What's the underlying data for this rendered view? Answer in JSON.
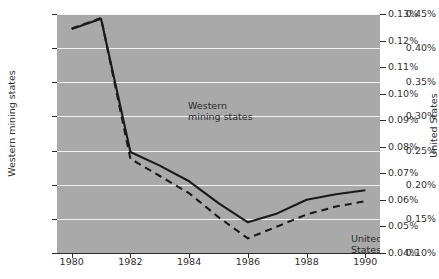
{
  "chart_data": {
    "type": "line",
    "title": "",
    "xlabel": "",
    "ylabel": "Western mining states",
    "y2label": "United States",
    "grid": true,
    "legend_position": "inline-annotation",
    "x": [
      1980,
      1981,
      1982,
      1983,
      1984,
      1985,
      1986,
      1987,
      1988,
      1989,
      1990
    ],
    "xlim": [
      1979.5,
      1990.5
    ],
    "xticks": [
      "1980",
      "1982",
      "1984",
      "1986",
      "1988",
      "1990"
    ],
    "xtick_values": [
      1980,
      1982,
      1984,
      1986,
      1988,
      1990
    ],
    "ylim": [
      0.1,
      0.45
    ],
    "yticks": [
      "0.10%",
      "0.15%",
      "0.20%",
      "0.25%",
      "0.30%",
      "0.35%",
      "0.40%",
      "0.45%"
    ],
    "ytick_values": [
      0.1,
      0.15,
      0.2,
      0.25,
      0.3,
      0.35,
      0.4,
      0.45
    ],
    "y2lim": [
      0.04,
      0.13
    ],
    "y2ticks": [
      "0.04%",
      "0.05%",
      "0.06%",
      "0.07%",
      "0.08%",
      "0.09%",
      "0.10%",
      "0.11%",
      "0.12%",
      "0.13%"
    ],
    "y2tick_values": [
      0.04,
      0.05,
      0.06,
      0.07,
      0.08,
      0.09,
      0.1,
      0.11,
      0.12,
      0.13
    ],
    "series": [
      {
        "name": "Western mining states",
        "axis": "left",
        "style": "solid",
        "color": "#1a1a1a",
        "values": [
          0.428,
          0.443,
          0.248,
          0.228,
          0.205,
          0.173,
          0.145,
          0.158,
          0.178,
          0.186,
          0.192
        ]
      },
      {
        "name": "United States",
        "axis": "right",
        "style": "dashed",
        "color": "#1a1a1a",
        "values": [
          0.1245,
          0.1285,
          0.0755,
          0.069,
          0.0625,
          0.0535,
          0.0455,
          0.05,
          0.0545,
          0.0575,
          0.0595
        ]
      }
    ],
    "annotations": [
      {
        "text": "Western",
        "text2": "mining states",
        "for": "Western mining states"
      },
      {
        "text": "United States",
        "for": "United States"
      }
    ]
  },
  "labels": {
    "y_axis_title": "Western mining states",
    "y2_axis_title": "United States",
    "annot_western_line1": "Western",
    "annot_western_line2": "mining states",
    "annot_us": "United States"
  },
  "colors": {
    "plot_background": "#a9a9a9",
    "gridline": "#f2f2f2",
    "line": "#1a1a1a",
    "text": "#2f2f2f"
  }
}
